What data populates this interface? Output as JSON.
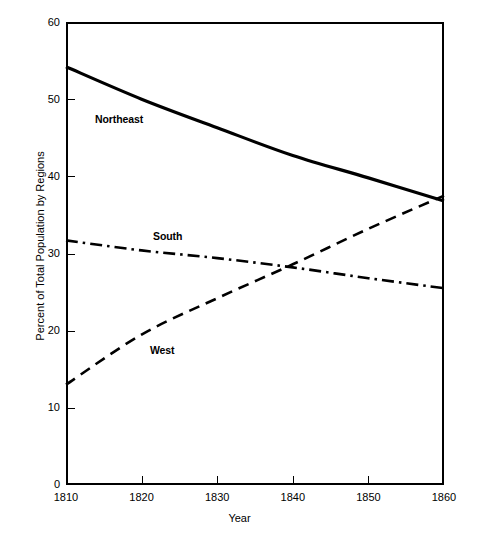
{
  "chart_data": {
    "type": "line",
    "title": "",
    "xlabel": "Year",
    "ylabel": "Percent of Total Population by Regions",
    "xlim": [
      1810,
      1860
    ],
    "ylim": [
      0,
      60
    ],
    "grid": false,
    "legend_position": "inline-labels",
    "xticks": [
      1810,
      1820,
      1830,
      1840,
      1850,
      1860
    ],
    "xtick_labels": [
      "1810",
      "1820",
      "1830",
      "1840",
      "1850",
      "1860"
    ],
    "yticks": [
      0,
      10,
      20,
      30,
      40,
      50,
      60
    ],
    "ytick_labels": [
      "0",
      "10",
      "20",
      "30",
      "40",
      "50",
      "60"
    ],
    "x": [
      1810,
      1820,
      1830,
      1840,
      1850,
      1860
    ],
    "series": [
      {
        "name": "Northeast",
        "style": "solid",
        "color": "#000000",
        "values": [
          54.2,
          50.0,
          46.3,
          42.7,
          39.8,
          36.8
        ]
      },
      {
        "name": "South",
        "style": "dash-dot",
        "color": "#000000",
        "values": [
          31.7,
          30.4,
          29.4,
          28.2,
          26.8,
          25.5
        ]
      },
      {
        "name": "West",
        "style": "dashed",
        "color": "#000000",
        "values": [
          13.0,
          19.5,
          24.2,
          28.6,
          33.2,
          37.5
        ]
      }
    ],
    "annotations": [
      {
        "text": "Northeast",
        "x": 1813.5,
        "y": 47.8
      },
      {
        "text": "South",
        "x": 1822.7,
        "y": 31.6
      },
      {
        "text": "West",
        "x": 1822.0,
        "y": 18.7
      }
    ]
  },
  "axes": {
    "x_title": "Year",
    "y_title": "Percent of Total Population by Regions"
  }
}
